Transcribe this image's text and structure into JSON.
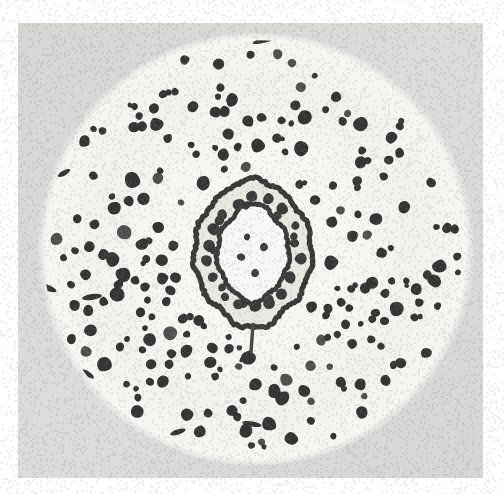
{
  "figure": {
    "kind": "micrograph",
    "caption_text": "",
    "width": 504,
    "height": 494
  },
  "canvas": {
    "width": 504,
    "height": 494,
    "page_background": "#ffffff",
    "plate_background": "#d5d5d3",
    "plate_background_light": "#dcdcda",
    "plate": {
      "x": 18,
      "y": 23,
      "width": 465,
      "height": 455
    }
  },
  "specimen": {
    "label": "stem-cross-section-disc",
    "center_x": 256,
    "center_y": 249,
    "radius_x": 216,
    "radius_y": 212,
    "fill_color": "#f6f6f3",
    "edge_softness": 14,
    "halo": {
      "inner_ratio": 0.46,
      "outer_ratio": 0.985,
      "color": "#eeeeea",
      "strength": 0.55
    }
  },
  "bundles": {
    "label": "vascular-bundle-dots",
    "color": "#353534",
    "color_light": "#50504e",
    "count_target": 360,
    "seed": 20240917,
    "min_radius_px": 3.0,
    "max_radius_px": 7.6,
    "inner_exclusion_ratio": 0.225,
    "outer_limit_ratio": 0.955,
    "ring_count": 13,
    "lobe_wobble": 0.42,
    "jitter": 0.52,
    "blob_lobes": 7,
    "blob_irregularity": 0.3,
    "clusters": [
      {
        "cx": 0.22,
        "cy": 0.6,
        "r": 0.17,
        "density": 1.75
      },
      {
        "cx": 0.3,
        "cy": 0.73,
        "r": 0.14,
        "density": 1.5
      },
      {
        "cx": 0.5,
        "cy": 0.82,
        "r": 0.16,
        "density": 1.35
      },
      {
        "cx": 0.76,
        "cy": 0.6,
        "r": 0.15,
        "density": 1.3
      },
      {
        "cx": 0.62,
        "cy": 0.22,
        "r": 0.15,
        "density": 1.15
      },
      {
        "cx": 0.38,
        "cy": 0.22,
        "r": 0.14,
        "density": 1.05
      }
    ],
    "streaks": [
      {
        "x": 265,
        "y": 40,
        "w": 26,
        "h": 5,
        "angle": -14
      },
      {
        "x": 340,
        "y": 48,
        "w": 24,
        "h": 5,
        "angle": 12
      },
      {
        "x": 64,
        "y": 173,
        "w": 14,
        "h": 5,
        "angle": -30
      },
      {
        "x": 48,
        "y": 288,
        "w": 18,
        "h": 6,
        "angle": 22
      },
      {
        "x": 92,
        "y": 297,
        "w": 20,
        "h": 6,
        "angle": -8
      },
      {
        "x": 252,
        "y": 424,
        "w": 20,
        "h": 5,
        "angle": 10
      },
      {
        "x": 178,
        "y": 432,
        "w": 16,
        "h": 5,
        "angle": -18
      },
      {
        "x": 88,
        "y": 374,
        "w": 14,
        "h": 5,
        "angle": 35
      },
      {
        "x": 246,
        "y": 356,
        "w": 17,
        "h": 6,
        "angle": -42
      }
    ]
  },
  "stele": {
    "label": "central-stele",
    "center_x": 253,
    "center_y": 253,
    "outer_ring": {
      "name": "endodermis-outer-ring",
      "radius_x": 59,
      "radius_y": 68,
      "stroke_width": 5.2,
      "stroke_color": "#3a3a38",
      "wobble_amplitude": 2.6,
      "wobble_lobes": 11,
      "point_top_y_offset": -6,
      "point_bottom_y_offset": 7
    },
    "inner_ring": {
      "name": "endodermis-inner-ring",
      "radius_x": 36,
      "radius_y": 44,
      "stroke_width": 4.6,
      "stroke_color": "#3a3a38",
      "wobble_amplitude": 1.9,
      "wobble_lobes": 9,
      "point_top_y_offset": -6,
      "point_bottom_y_offset": 6
    },
    "cortex_fill": "#e9e9e4",
    "pith_fill": "#f7f7f5",
    "ring_dots": {
      "color": "#3c3c3a",
      "outer_band_count": 18,
      "outer_band_radius_ratio": 0.78,
      "outer_band_dot_radius": 5.6,
      "inner_band_count": 9,
      "inner_band_radius_ratio": 0.58,
      "inner_band_dot_radius": 4.6,
      "pith_dots": [
        {
          "x": -12,
          "y": 4,
          "r": 4.4
        },
        {
          "x": 11,
          "y": -6,
          "r": 4.6
        },
        {
          "x": 2,
          "y": 20,
          "r": 4.2
        },
        {
          "x": -6,
          "y": -16,
          "r": 3.6
        }
      ]
    },
    "seam": {
      "name": "ventral-seam",
      "x_offset": 0,
      "y_start": 72,
      "y_end": 98,
      "width": 3.4,
      "color": "#4a4a46"
    }
  },
  "grain": {
    "label": "photographic-grain",
    "opacity": 0.055,
    "cell": 2,
    "seed": 777
  },
  "accessibility": {
    "alt_text": "Black and white micrograph of a circular plant stem cross-section showing numerous dark vascular bundles scattered radially around a central concentric ring stele."
  }
}
